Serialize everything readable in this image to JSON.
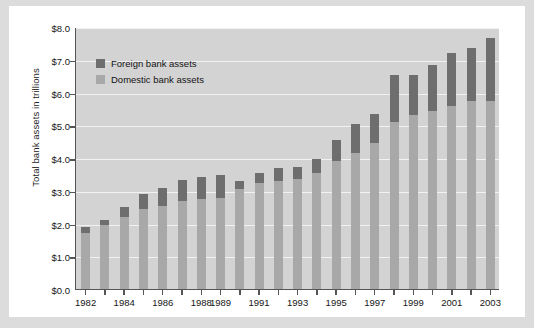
{
  "chart_data": {
    "type": "bar",
    "stacked": true,
    "title": "",
    "xlabel": "",
    "ylabel": "Total bank assets in trillions",
    "ylim": [
      0,
      8
    ],
    "ytick_labels": [
      "$0.0",
      "$1.0",
      "$2.0",
      "$3.0",
      "$4.0",
      "$5.0",
      "$6.0",
      "$7.0",
      "$8.0"
    ],
    "ytick_values": [
      0,
      1,
      2,
      3,
      4,
      5,
      6,
      7,
      8
    ],
    "grid": true,
    "legend_position": "upper-left",
    "categories": [
      "1982",
      "1983",
      "1984",
      "1985",
      "1986",
      "1987",
      "1988",
      "1989",
      "1990",
      "1991",
      "1992",
      "1993",
      "1994",
      "1995",
      "1996",
      "1997",
      "1998",
      "1999",
      "2000",
      "2001",
      "2002",
      "2003"
    ],
    "xtick_labels_shown": [
      "1982",
      "",
      "1984",
      "",
      "1986",
      "",
      "1988",
      "1989",
      "",
      "1991",
      "",
      "1993",
      "",
      "1995",
      "",
      "1997",
      "",
      "1999",
      "",
      "2001",
      "",
      "2003"
    ],
    "xtick_labels_visible": [
      "1982",
      "1986",
      "1989",
      "1991",
      "1993",
      "1995",
      "1997",
      "1999",
      "2001",
      "2003"
    ],
    "series": [
      {
        "name": "Domestic bank assets",
        "color": "#a8a8a8",
        "values": [
          1.72,
          1.95,
          2.2,
          2.43,
          2.55,
          2.7,
          2.75,
          2.78,
          3.05,
          3.25,
          3.3,
          3.35,
          3.55,
          3.9,
          4.15,
          4.45,
          5.1,
          5.3,
          5.45,
          5.6,
          5.75,
          5.75
        ]
      },
      {
        "name": "Foreign bank assets",
        "color": "#6e6e6e",
        "values": [
          0.16,
          0.17,
          0.3,
          0.48,
          0.53,
          0.64,
          0.66,
          0.71,
          0.25,
          0.28,
          0.4,
          0.38,
          0.43,
          0.65,
          0.9,
          0.88,
          1.42,
          1.25,
          1.4,
          1.6,
          1.6,
          1.9
        ]
      }
    ],
    "totals": [
      1.88,
      2.12,
      2.5,
      2.91,
      3.08,
      3.34,
      3.41,
      3.49,
      3.3,
      3.53,
      3.7,
      3.73,
      3.98,
      4.55,
      5.05,
      5.33,
      6.52,
      6.55,
      6.85,
      7.2,
      7.35,
      7.65
    ],
    "legend": [
      {
        "label": "Foreign bank assets",
        "color": "#6e6e6e"
      },
      {
        "label": "Domestic bank assets",
        "color": "#a8a8a8"
      }
    ]
  }
}
